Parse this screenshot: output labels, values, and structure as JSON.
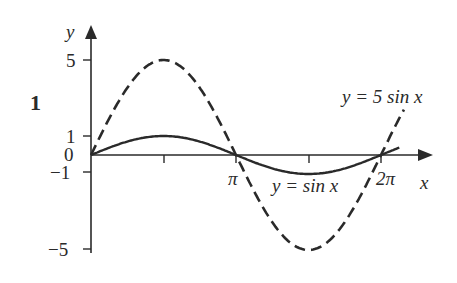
{
  "figure": {
    "number_label": "1",
    "axes": {
      "x_label": "x",
      "y_label": "y",
      "y_ticks": [
        {
          "value": 5,
          "label": "5"
        },
        {
          "value": 1,
          "label": "1"
        },
        {
          "value": 0,
          "label": "0"
        },
        {
          "value": -1,
          "label": "−1"
        },
        {
          "value": -5,
          "label": "−5"
        }
      ],
      "x_ticks": [
        {
          "value": "pi/2",
          "label": ""
        },
        {
          "value": "pi",
          "label": "π"
        },
        {
          "value": "3pi/2",
          "label": ""
        },
        {
          "value": "2pi",
          "label": "2π"
        }
      ]
    },
    "curves": [
      {
        "name": "y = 5 sin x",
        "label": "y = 5 sin x",
        "style": "dashed",
        "amplitude": 5
      },
      {
        "name": "y = sin x",
        "label": "y = sin x",
        "style": "solid",
        "amplitude": 1
      }
    ],
    "colors": {
      "ink": "#2a2a2a",
      "background": "#ffffff"
    }
  },
  "chart_data": {
    "type": "line",
    "title": "",
    "xlabel": "x",
    "ylabel": "y",
    "xlim": [
      0,
      6.7
    ],
    "ylim": [
      -5,
      5
    ],
    "x_tick_labels": [
      "π",
      "2π"
    ],
    "y_tick_labels": [
      "5",
      "1",
      "0",
      "−1",
      "−5"
    ],
    "series": [
      {
        "name": "y = 5 sin x",
        "style": "dashed",
        "x": [
          0,
          1.5708,
          3.1416,
          4.7124,
          6.2832,
          6.78
        ],
        "y": [
          0,
          5,
          0,
          -5,
          0,
          2.4
        ]
      },
      {
        "name": "y = sin x",
        "style": "solid",
        "x": [
          0,
          1.5708,
          3.1416,
          4.7124,
          6.2832,
          6.68
        ],
        "y": [
          0,
          1,
          0,
          -1,
          0,
          0.39
        ]
      }
    ],
    "annotations": [
      "1",
      "y = 5 sin x",
      "y = sin x"
    ],
    "grid": false,
    "legend": "none (inline labels)"
  }
}
